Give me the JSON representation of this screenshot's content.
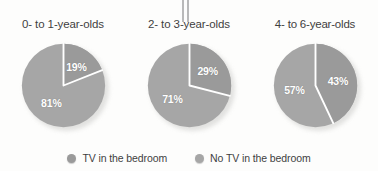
{
  "figure": {
    "background_color": "#fdfdfc",
    "title_color": "#3f3f3f",
    "label_color": "#ffffff"
  },
  "legend": {
    "items": [
      {
        "label": "TV in the bedroom",
        "color": "#9a9a9a",
        "swatch_name": "legend-swatch-tv"
      },
      {
        "label": "No TV in the bedroom",
        "color": "#a6a6a6",
        "swatch_name": "legend-swatch-no-tv"
      }
    ]
  },
  "panels": [
    {
      "title": "0- to 1-year-olds",
      "tv_label": "19%",
      "no_tv_label": "81%"
    },
    {
      "title": "2- to 3-year-olds",
      "tv_label": "29%",
      "no_tv_label": "71%"
    },
    {
      "title": "4- to 6-year-olds",
      "tv_label": "43%",
      "no_tv_label": "57%"
    }
  ],
  "chart_data": [
    {
      "type": "pie",
      "title": "0- to 1-year-olds",
      "labels": [
        "TV in the bedroom",
        "No TV in the bedroom"
      ],
      "values": [
        19,
        81
      ],
      "data_labels": [
        "19%",
        "81%"
      ],
      "colors": [
        "#9a9a9a",
        "#a6a6a6"
      ],
      "units": "percent",
      "start_angle_deg": 0,
      "direction": "clockwise",
      "legend_position": "bottom"
    },
    {
      "type": "pie",
      "title": "2- to 3-year-olds",
      "labels": [
        "TV in the bedroom",
        "No TV in the bedroom"
      ],
      "values": [
        29,
        71
      ],
      "data_labels": [
        "29%",
        "71%"
      ],
      "colors": [
        "#9a9a9a",
        "#a6a6a6"
      ],
      "units": "percent",
      "start_angle_deg": 0,
      "direction": "clockwise",
      "legend_position": "bottom"
    },
    {
      "type": "pie",
      "title": "4- to 6-year-olds",
      "labels": [
        "TV in the bedroom",
        "No TV in the bedroom"
      ],
      "values": [
        43,
        57
      ],
      "data_labels": [
        "43%",
        "57%"
      ],
      "colors": [
        "#9a9a9a",
        "#a6a6a6"
      ],
      "units": "percent",
      "start_angle_deg": 0,
      "direction": "clockwise",
      "legend_position": "bottom"
    }
  ]
}
